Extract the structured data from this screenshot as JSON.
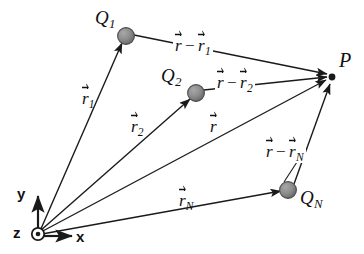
{
  "figure": {
    "background_color": "#ffffff",
    "stroke_color": "#1a1a1a",
    "charge_fill_color": "#8c8c8c",
    "charge_edge_color": "#4d4d4d"
  },
  "origin": {
    "x": 38,
    "y": 233,
    "z_axis_label": "z",
    "y_axis_label": "y",
    "x_axis_label": "x"
  },
  "field_point": {
    "label": "P",
    "x": 332,
    "y": 77
  },
  "charges": [
    {
      "name": "Q1",
      "label_base": "Q",
      "label_sub": "1",
      "x": 126,
      "y": 36
    },
    {
      "name": "Q2",
      "label_base": "Q",
      "label_sub": "2",
      "x": 196,
      "y": 93
    },
    {
      "name": "QN",
      "label_base": "Q",
      "label_sub": "N",
      "x": 288,
      "y": 190
    }
  ],
  "position_vectors": [
    {
      "name": "r1",
      "base": "r",
      "sub": "1",
      "from": "origin",
      "to": "Q1"
    },
    {
      "name": "r2",
      "base": "r",
      "sub": "2",
      "from": "origin",
      "to": "Q2"
    },
    {
      "name": "r",
      "base": "r",
      "sub": "",
      "from": "origin",
      "to": "P"
    },
    {
      "name": "rN",
      "base": "r",
      "sub": "N",
      "from": "origin",
      "to": "QN"
    }
  ],
  "separation_vectors": [
    {
      "name": "r-minus-r1",
      "base": "r",
      "minus": "−",
      "base2": "r",
      "sub2": "1",
      "from": "Q1",
      "to": "P"
    },
    {
      "name": "r-minus-r2",
      "base": "r",
      "minus": "−",
      "base2": "r",
      "sub2": "2",
      "from": "Q2",
      "to": "P"
    },
    {
      "name": "r-minus-rN",
      "base": "r",
      "minus": "−",
      "base2": "r",
      "sub2": "N",
      "from": "QN",
      "to": "P"
    }
  ]
}
